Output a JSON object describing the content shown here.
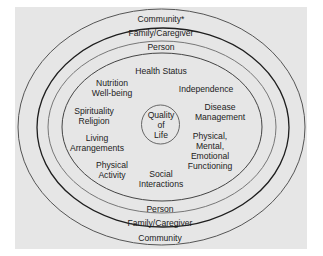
{
  "diagram": {
    "center": {
      "lines": [
        "Quality",
        "of",
        "Life"
      ]
    },
    "rings": {
      "community_top": "Community*",
      "family_top": "Family/Caregiver",
      "person_top": "Person",
      "person_bottom": "Person",
      "family_bottom": "Family/Caregiver",
      "community_bottom": "Community"
    },
    "factors": [
      {
        "id": "health-status",
        "lines": [
          "Health Status"
        ]
      },
      {
        "id": "nutrition",
        "lines": [
          "Nutrition",
          "Well-being"
        ]
      },
      {
        "id": "independence",
        "lines": [
          "Independence"
        ]
      },
      {
        "id": "spirituality",
        "lines": [
          "Spirituality",
          "Religion"
        ]
      },
      {
        "id": "disease-management",
        "lines": [
          "Disease",
          "Management"
        ]
      },
      {
        "id": "living-arrangements",
        "lines": [
          "Living",
          "Arrangements"
        ]
      },
      {
        "id": "functioning",
        "lines": [
          "Physical,",
          "Mental,",
          "Emotional",
          "Functioning"
        ]
      },
      {
        "id": "physical-activity",
        "lines": [
          "Physical",
          "Activity"
        ]
      },
      {
        "id": "social-interactions",
        "lines": [
          "Social",
          "Interactions"
        ]
      }
    ],
    "colors": {
      "background": "#e6e6e6",
      "outer_ring": "#555555",
      "family_ring": "#1e1e1e",
      "person_ring": "#777777",
      "inner_ring": "#444444",
      "text": "#222222"
    }
  }
}
